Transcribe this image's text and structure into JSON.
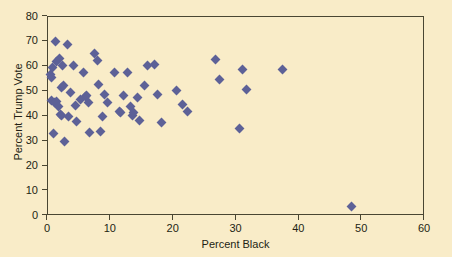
{
  "chart_data": {
    "type": "scatter",
    "title": "",
    "xlabel": "Percent Black",
    "ylabel": "Percent Trump Vote",
    "xlim": [
      0,
      60
    ],
    "ylim": [
      0,
      80
    ],
    "xticks": [
      0,
      10,
      20,
      30,
      40,
      50,
      60
    ],
    "yticks": [
      0,
      10,
      20,
      30,
      40,
      50,
      60,
      70,
      80
    ],
    "grid": false,
    "legend": null,
    "marker": "diamond",
    "marker_color": "#5d6197",
    "background_color": "#f9ecc8",
    "axis_color": "#4a4632",
    "points": [
      {
        "x": 0.4,
        "y": 57.0
      },
      {
        "x": 0.5,
        "y": 55.5
      },
      {
        "x": 0.6,
        "y": 46.5
      },
      {
        "x": 0.7,
        "y": 59.5
      },
      {
        "x": 0.8,
        "y": 33.0
      },
      {
        "x": 1.0,
        "y": 45.5
      },
      {
        "x": 1.2,
        "y": 70.3
      },
      {
        "x": 1.3,
        "y": 62.0
      },
      {
        "x": 1.4,
        "y": 46.0
      },
      {
        "x": 1.6,
        "y": 44.0
      },
      {
        "x": 1.8,
        "y": 63.5
      },
      {
        "x": 2.0,
        "y": 41.0
      },
      {
        "x": 2.1,
        "y": 40.5
      },
      {
        "x": 2.2,
        "y": 51.5
      },
      {
        "x": 2.3,
        "y": 60.5
      },
      {
        "x": 2.5,
        "y": 52.5
      },
      {
        "x": 2.7,
        "y": 30.0
      },
      {
        "x": 3.1,
        "y": 69.0
      },
      {
        "x": 3.3,
        "y": 40.0
      },
      {
        "x": 3.6,
        "y": 49.5
      },
      {
        "x": 4.0,
        "y": 60.5
      },
      {
        "x": 4.3,
        "y": 44.5
      },
      {
        "x": 4.6,
        "y": 37.8
      },
      {
        "x": 5.2,
        "y": 47.0
      },
      {
        "x": 5.6,
        "y": 57.5
      },
      {
        "x": 6.0,
        "y": 48.0
      },
      {
        "x": 6.2,
        "y": 48.5
      },
      {
        "x": 6.4,
        "y": 45.5
      },
      {
        "x": 6.6,
        "y": 33.5
      },
      {
        "x": 7.4,
        "y": 65.5
      },
      {
        "x": 7.8,
        "y": 62.5
      },
      {
        "x": 8.0,
        "y": 53.0
      },
      {
        "x": 8.3,
        "y": 34.0
      },
      {
        "x": 8.6,
        "y": 40.0
      },
      {
        "x": 9.0,
        "y": 49.0
      },
      {
        "x": 9.4,
        "y": 45.5
      },
      {
        "x": 10.6,
        "y": 57.5
      },
      {
        "x": 11.3,
        "y": 42.0
      },
      {
        "x": 11.6,
        "y": 41.5
      },
      {
        "x": 12.0,
        "y": 48.5
      },
      {
        "x": 12.6,
        "y": 57.5
      },
      {
        "x": 13.1,
        "y": 44.0
      },
      {
        "x": 13.4,
        "y": 40.5
      },
      {
        "x": 13.6,
        "y": 41.5
      },
      {
        "x": 14.2,
        "y": 47.5
      },
      {
        "x": 14.6,
        "y": 38.5
      },
      {
        "x": 15.4,
        "y": 52.5
      },
      {
        "x": 15.8,
        "y": 60.5
      },
      {
        "x": 16.9,
        "y": 61.0
      },
      {
        "x": 17.4,
        "y": 49.0
      },
      {
        "x": 18.0,
        "y": 37.5
      },
      {
        "x": 20.5,
        "y": 50.5
      },
      {
        "x": 21.4,
        "y": 45.0
      },
      {
        "x": 22.2,
        "y": 42.0
      },
      {
        "x": 26.6,
        "y": 63.0
      },
      {
        "x": 27.3,
        "y": 55.0
      },
      {
        "x": 30.4,
        "y": 35.0
      },
      {
        "x": 31.0,
        "y": 59.0
      },
      {
        "x": 31.6,
        "y": 51.0
      },
      {
        "x": 37.4,
        "y": 59.0
      },
      {
        "x": 48.3,
        "y": 4.0
      }
    ]
  }
}
